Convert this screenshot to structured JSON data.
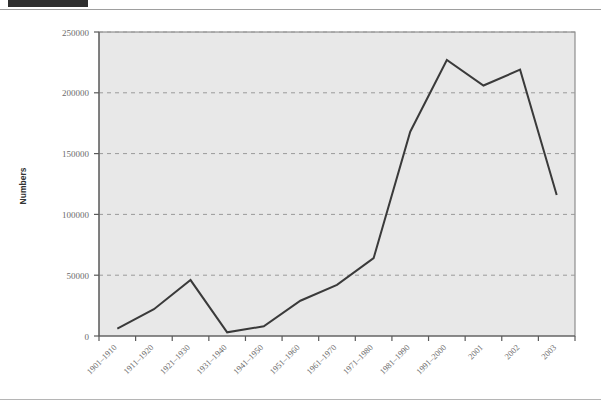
{
  "header": {
    "black_block": "",
    "faint_text": ""
  },
  "chart_data": {
    "type": "line",
    "title": "",
    "xlabel": "",
    "ylabel": "Numbers",
    "ylim": [
      0,
      250000
    ],
    "ytick_labels": [
      "0",
      "50000",
      "100000",
      "150000",
      "200000",
      "250000"
    ],
    "yticks": [
      0,
      50000,
      100000,
      150000,
      200000,
      250000
    ],
    "grid": "horizontal-dashed",
    "legend": "none",
    "plot_background": "#e8e8e8",
    "line_color": "#3a3a3a",
    "line_width": 2,
    "categories": [
      "1901–1910",
      "1911–1920",
      "1921–1930",
      "1931–1940",
      "1941–1950",
      "1951–1960",
      "1961–1970",
      "1971–1980",
      "1981–1990",
      "1991–2000",
      "2001",
      "2002",
      "2003"
    ],
    "values": [
      6000,
      22000,
      46000,
      3000,
      8000,
      29000,
      42000,
      64000,
      168000,
      227000,
      206000,
      219000,
      116000
    ]
  }
}
